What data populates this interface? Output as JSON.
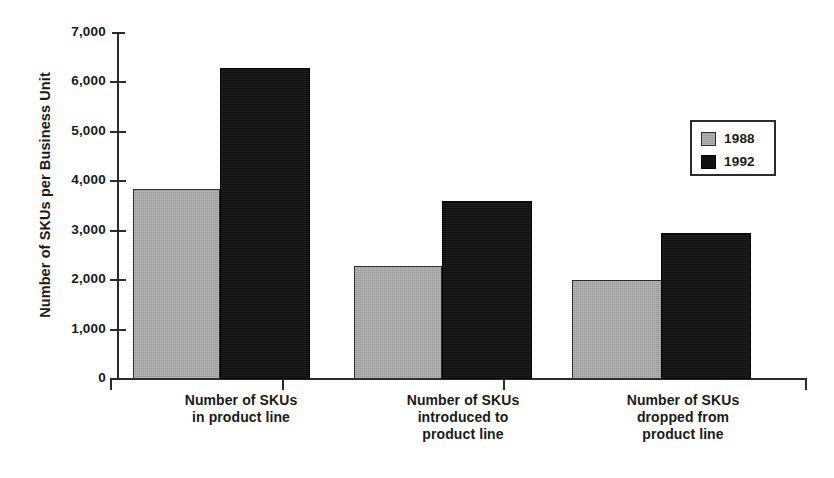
{
  "chart_data": {
    "type": "bar",
    "title": "",
    "xlabel": "",
    "ylabel": "Number of SKUs per Business Unit",
    "ylim": [
      0,
      7000
    ],
    "ytick_values": [
      0,
      1000,
      2000,
      3000,
      4000,
      5000,
      6000,
      7000
    ],
    "ytick_labels": [
      "0",
      "1,000",
      "2,000",
      "3,000",
      "4,000",
      "5,000",
      "6,000",
      "7,000"
    ],
    "grid": false,
    "legend_position": "upper right",
    "categories": [
      "Number of SKUs\nin product line",
      "Number of SKUs\nintroduced to\nproduct line",
      "Number of SKUs\ndropped from\nproduct line"
    ],
    "category_lines": [
      [
        "Number of SKUs",
        "in product line"
      ],
      [
        "Number of SKUs",
        "introduced to",
        "product line"
      ],
      [
        "Number of SKUs",
        "dropped from",
        "product line"
      ]
    ],
    "series": [
      {
        "name": "1988",
        "color": "#a8a8a8",
        "values": [
          3850,
          2280,
          2000
        ]
      },
      {
        "name": "1992",
        "color": "#111111",
        "values": [
          6300,
          3600,
          2950
        ]
      }
    ]
  },
  "legend": {
    "items": [
      {
        "label": "1988",
        "color": "#a8a8a8"
      },
      {
        "label": "1992",
        "color": "#111111"
      }
    ]
  },
  "axis": {
    "y_title": "Number of SKUs per Business Unit"
  },
  "colors": {
    "series_1988": "#a8a8a8",
    "series_1992": "#111111",
    "axis": "#2b2b2b",
    "background": "#ffffff"
  }
}
